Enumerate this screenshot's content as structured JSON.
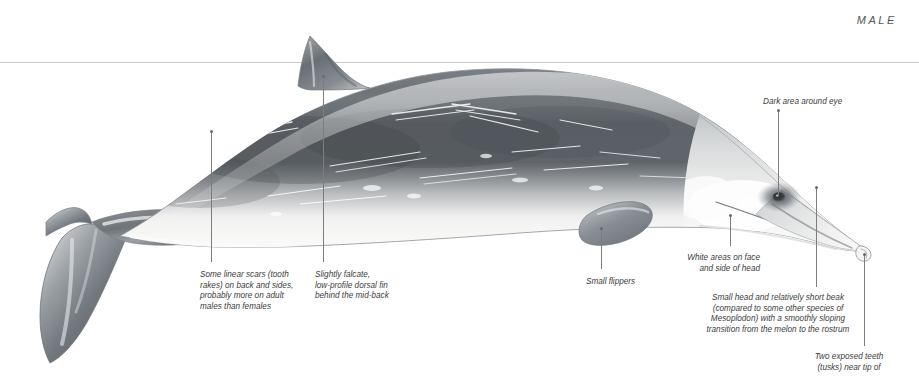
{
  "header": {
    "sex_label": "MALE"
  },
  "illustration": {
    "subject": "beaked-whale-lateral-view",
    "body_dark": "#6f7378",
    "body_mid": "#9aa0a6",
    "body_pale": "#f2f2f0",
    "outline": "#8d9298",
    "scar_color": "#ffffff",
    "eye_color": "#3a3a3c",
    "horizon_color": "#c8c8c8",
    "leader_color": "#7d7d7d",
    "text_color": "#3d3d3d"
  },
  "callouts": [
    {
      "id": "linear-scars",
      "text": "Some linear scars (tooth\nrakes) on back and sides,\nprobably more on adult\nmales than females",
      "align": "left",
      "text_x": 200,
      "text_y": 270,
      "text_width": 120,
      "leader_x": 211,
      "leader_top": 131,
      "leader_bottom": 262
    },
    {
      "id": "dorsal-fin",
      "text": "Slightly falcate,\nlow-profile dorsal fin\nbehind the mid-back",
      "align": "left",
      "text_x": 315,
      "text_y": 270,
      "text_width": 110,
      "leader_x": 323,
      "leader_top": 76,
      "leader_bottom": 262
    },
    {
      "id": "small-flippers",
      "text": "Small flippers",
      "align": "left",
      "text_x": 586,
      "text_y": 277,
      "text_width": 90,
      "leader_x": 601,
      "leader_top": 228,
      "leader_bottom": 269
    },
    {
      "id": "white-areas-face",
      "text": "White areas on face\nand side of head",
      "align": "right",
      "text_x": 668,
      "text_y": 253,
      "text_width": 92,
      "leader_x": 730,
      "leader_top": 215,
      "leader_bottom": 246
    },
    {
      "id": "dark-area-eye",
      "text": "Dark area around eye",
      "align": "left",
      "text_x": 763,
      "text_y": 97,
      "text_width": 100,
      "leader_x": 778,
      "leader_top": 110,
      "leader_bottom": 196
    },
    {
      "id": "small-head-short-beak",
      "text": "Small head and relatively short beak\n(compared to some other species of\nMesoplodon) with a smoothly sloping\ntransition from the melon to the rostrum",
      "align": "center",
      "text_x": 696,
      "text_y": 293,
      "text_width": 164,
      "leader_x": 816,
      "leader_top": 187,
      "leader_bottom": 287
    },
    {
      "id": "exposed-teeth",
      "text": "Two exposed teeth\n(tusks) near tip of",
      "align": "center",
      "text_x": 788,
      "text_y": 352,
      "text_width": 122,
      "leader_x": 864,
      "leader_top": 254,
      "leader_bottom": 346
    }
  ]
}
